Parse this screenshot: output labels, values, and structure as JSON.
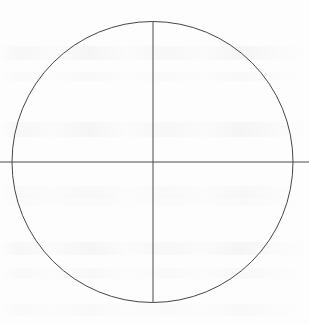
{
  "figure": {
    "background_color": "#fdfdfd",
    "stroke_color": "#4a4a4a",
    "canvas": {
      "width": 309,
      "height": 324
    }
  },
  "chart_data": {
    "type": "diagram",
    "title": "",
    "subtitle": "",
    "xlabel": "",
    "ylabel": "",
    "grid": false,
    "legend": null,
    "annotations": [],
    "shapes": [
      {
        "name": "circle",
        "kind": "circle",
        "center_x": 152.5,
        "center_y": 162,
        "radius": 140.5,
        "stroke": "#474747",
        "stroke_width": 1,
        "fill": "none"
      },
      {
        "name": "vertical-diameter",
        "kind": "line",
        "x1": 153,
        "y1": 21.5,
        "x2": 153,
        "y2": 302.5,
        "stroke": "#4a4a4a",
        "stroke_width": 1,
        "extends_beyond_circle": false
      },
      {
        "name": "horizontal-diameter",
        "kind": "line",
        "x1": 0,
        "y1": 162,
        "x2": 309,
        "y2": 162,
        "stroke": "#4a4a4a",
        "stroke_width": 1,
        "extends_beyond_circle": true
      }
    ],
    "quadrants": [
      {
        "name": "upper-left",
        "position": "top-left"
      },
      {
        "name": "upper-right",
        "position": "top-right"
      },
      {
        "name": "lower-left",
        "position": "bottom-left"
      },
      {
        "name": "lower-right",
        "position": "bottom-right"
      }
    ]
  },
  "artifacts": {
    "description": "Faint illegible show-through text from the reverse side of the page",
    "legible": false,
    "bands": [
      {
        "top": 46,
        "height": 14
      },
      {
        "top": 72,
        "height": 9
      },
      {
        "top": 122,
        "height": 15
      },
      {
        "top": 186,
        "height": 11
      },
      {
        "top": 196,
        "height": 10
      },
      {
        "top": 242,
        "height": 13
      },
      {
        "top": 268,
        "height": 11
      },
      {
        "top": 304,
        "height": 12
      }
    ]
  }
}
